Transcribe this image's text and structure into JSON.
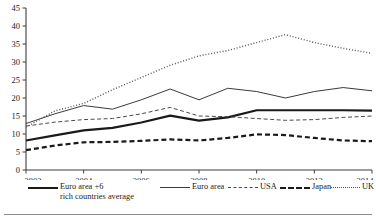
{
  "chart_data": {
    "type": "line",
    "title": "",
    "subtitle": "",
    "xlabel": "",
    "ylabel": "",
    "grid": false,
    "legend_position": "bottom",
    "x": [
      2002,
      2003,
      2004,
      2005,
      2006,
      2007,
      2008,
      2009,
      2010,
      2011,
      2012,
      2013,
      2014
    ],
    "xlim": [
      2002,
      2014
    ],
    "ylim": [
      0,
      45
    ],
    "xticks": [
      "2002",
      "2004",
      "2006",
      "2008",
      "2010",
      "2012",
      "2014"
    ],
    "xtick_values": [
      2002,
      2004,
      2006,
      2008,
      2010,
      2012,
      2014
    ],
    "yticks": [
      "0",
      "5",
      "10",
      "15",
      "20",
      "25",
      "30",
      "35",
      "40",
      "45"
    ],
    "ytick_values": [
      0,
      5,
      10,
      15,
      20,
      25,
      30,
      35,
      40,
      45
    ],
    "series": [
      {
        "name": "Euro area +6 rich countries average",
        "style": "thick-solid",
        "color": "#1a1a1a",
        "values": [
          8.2,
          9.6,
          11.0,
          11.7,
          13.2,
          15.1,
          13.7,
          14.6,
          16.6,
          16.6,
          16.6,
          16.6,
          16.5
        ]
      },
      {
        "name": "Euro area",
        "style": "thin-solid",
        "color": "#3a3a3a",
        "values": [
          12.9,
          15.6,
          17.9,
          16.9,
          19.5,
          22.5,
          19.5,
          22.7,
          21.8,
          20.0,
          21.8,
          22.9,
          22.0
        ]
      },
      {
        "name": "USA",
        "style": "thin-dashed",
        "color": "#4a4a4a",
        "values": [
          12.2,
          13.3,
          14.0,
          14.3,
          15.6,
          17.4,
          15.0,
          14.8,
          14.3,
          13.8,
          14.0,
          14.6,
          15.0
        ]
      },
      {
        "name": "Japan",
        "style": "thick-dashed",
        "color": "#1a1a1a",
        "values": [
          5.5,
          6.8,
          7.7,
          7.8,
          8.1,
          8.5,
          8.2,
          8.9,
          9.9,
          9.7,
          8.9,
          8.2,
          8.0
        ]
      },
      {
        "name": "UK",
        "style": "dotted",
        "color": "#555555",
        "values": [
          11.9,
          16.4,
          18.5,
          22.3,
          25.7,
          29.1,
          31.7,
          33.2,
          35.4,
          37.6,
          35.4,
          33.8,
          32.4
        ]
      }
    ]
  },
  "axis": {
    "y_tick_labels": [
      "45",
      "40",
      "35",
      "30",
      "25",
      "20",
      "15",
      "10",
      "5",
      "0"
    ],
    "x_tick_labels": [
      "2002",
      "2004",
      "2006",
      "2008",
      "2010",
      "2012",
      "2014"
    ]
  },
  "legend": {
    "items": [
      {
        "label_line1": "Euro area +6",
        "label_line2": "rich countries average",
        "key": "thick-solid"
      },
      {
        "label_line1": "Euro area",
        "label_line2": "",
        "key": "thin-solid"
      },
      {
        "label_line1": "USA",
        "label_line2": "",
        "key": "thin-dashed"
      },
      {
        "label_line1": "Japan",
        "label_line2": "",
        "key": "thick-dashed"
      },
      {
        "label_line1": "UK",
        "label_line2": "",
        "key": "dotted"
      }
    ]
  },
  "colors": {
    "ink": "#1a1a1a",
    "axis": "#3d3d3d",
    "rule": "#8c8c8c",
    "background": "#ffffff"
  }
}
